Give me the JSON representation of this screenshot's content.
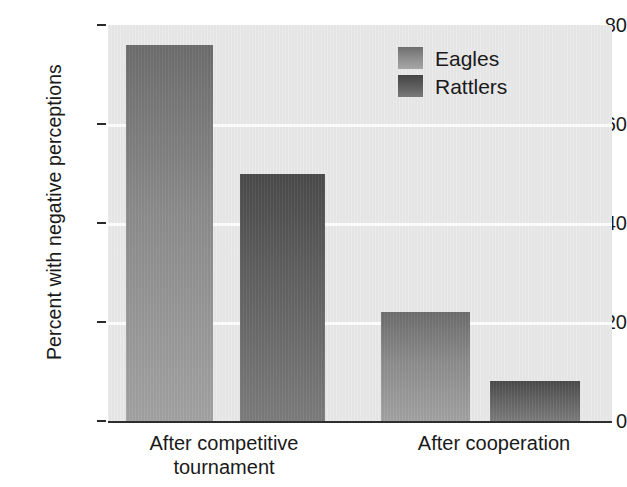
{
  "chart_data": {
    "type": "bar",
    "title": "",
    "subtitle": "",
    "xlabel": "",
    "ylabel": "Percent with negative perceptions",
    "categories": [
      "After competitive\ntournament",
      "After cooperation"
    ],
    "series": [
      {
        "name": "Eagles",
        "values": [
          76,
          22
        ],
        "color": "#8d8d8d"
      },
      {
        "name": "Rattlers",
        "values": [
          50,
          8
        ],
        "color": "#5d5d5d"
      }
    ],
    "ylim": [
      0,
      80
    ],
    "yticks": [
      0,
      20,
      40,
      60,
      80
    ],
    "ytick_labels": [
      "0",
      "20",
      "40",
      "60",
      "80"
    ],
    "grid": "horizontal",
    "legend_position": "top-right",
    "plot_background": "#e7e7e7",
    "gridline_color": "#fbfbfb",
    "axis_color": "#2e2e2e"
  },
  "axis": {
    "y": {
      "label": "Percent with negative perceptions",
      "ticks": [
        {
          "value": "80"
        },
        {
          "value": "60"
        },
        {
          "value": "40"
        },
        {
          "value": "20"
        },
        {
          "value": "0"
        }
      ]
    },
    "x": {
      "ticks": [
        {
          "label": "After competitive\ntournament"
        },
        {
          "label": "After cooperation"
        }
      ]
    }
  },
  "legend": {
    "items": [
      {
        "label": "Eagles"
      },
      {
        "label": "Rattlers"
      }
    ]
  }
}
